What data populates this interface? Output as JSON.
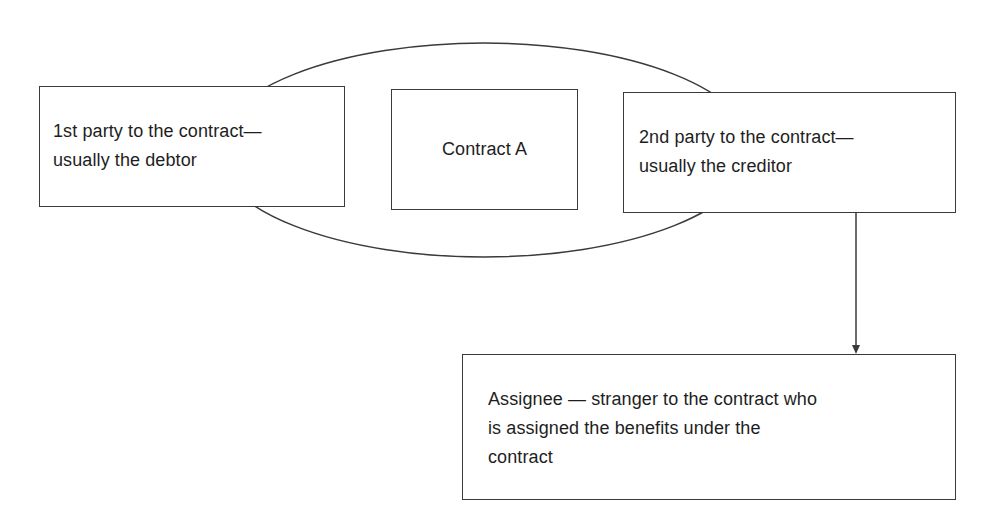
{
  "diagram": {
    "ellipse": {
      "label": "Contract A scope"
    },
    "nodes": [
      {
        "id": "first-party",
        "text": "1st party to the contract—\nusually the debtor"
      },
      {
        "id": "contract",
        "text": "Contract A"
      },
      {
        "id": "second-party",
        "text": "2nd party to the contract—\nusually the creditor"
      },
      {
        "id": "assignee",
        "text": "Assignee — stranger to the contract who\nis assigned the benefits under the\ncontract"
      }
    ],
    "edges": [
      {
        "from": "second-party",
        "to": "assignee",
        "type": "arrow"
      }
    ],
    "colors": {
      "line": "#3a3a3a",
      "text": "#1e1e1e",
      "background": "#ffffff"
    }
  }
}
